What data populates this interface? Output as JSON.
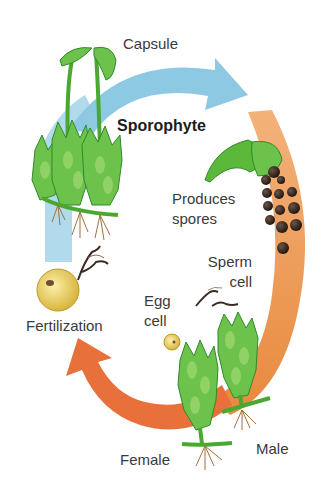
{
  "diagram": {
    "labels": {
      "capsule": "Capsule",
      "sporophyte": "Sporophyte",
      "produces_spores_line1": "Produces",
      "produces_spores_line2": "spores",
      "sperm_cell_line1": "Sperm",
      "sperm_cell_line2": "cell",
      "egg_cell_line1": "Egg",
      "egg_cell_line2": "cell",
      "fertilization": "Fertilization",
      "female": "Female",
      "male": "Male"
    },
    "stages": [
      {
        "name": "Sporophyte",
        "arrow_color": "#8ec9e3"
      },
      {
        "name": "Produces spores",
        "arrow_color": "#f0ad6e"
      },
      {
        "name": "Female / Male gametophytes",
        "arrow_color": "#e8703a"
      },
      {
        "name": "Fertilization",
        "arrow_color": "#8ec9e3"
      }
    ],
    "colors": {
      "blue_arrow": "#8ec9e3",
      "orange_arrow": "#f0ad6e",
      "red_orange_arrow": "#e8703a",
      "moss_green": "#5cb83a",
      "moss_dark": "#2f8a2a",
      "spore": "#3a2a22",
      "egg": "#e8d36a",
      "root": "#b07a4a"
    }
  }
}
